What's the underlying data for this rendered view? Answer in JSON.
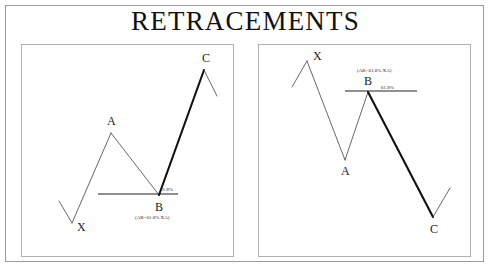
{
  "title": "RETRACEMENTS",
  "colors": {
    "stroke_thin": "#4a4a55",
    "stroke_thick": "#111111",
    "retracement_line": "#222222",
    "panel_border": "#b0b0b0",
    "outer_border": "#9a9a9a",
    "text": "#111111",
    "background": "#ffffff"
  },
  "charts": [
    {
      "name": "bullish-retracement",
      "labels": {
        "x": "X",
        "a": "A",
        "b": "B",
        "c": "C",
        "ratio": "61.8%",
        "formula": "(AB=61.8% XA)"
      },
      "points": {
        "lead_start": {
          "x": 37,
          "y": 156
        },
        "x": {
          "x": 50,
          "y": 178
        },
        "a": {
          "x": 89,
          "y": 88
        },
        "b": {
          "x": 137,
          "y": 150
        },
        "c": {
          "x": 182,
          "y": 25
        },
        "tail_end": {
          "x": 195,
          "y": 51
        }
      },
      "retracement_line": {
        "x1": 76,
        "x2": 156,
        "y": 149
      },
      "label_positions": {
        "x": {
          "x": 55,
          "y": 186
        },
        "a": {
          "x": 85,
          "y": 80
        },
        "b": {
          "x": 133,
          "y": 166
        },
        "c": {
          "x": 180,
          "y": 17
        },
        "ratio": {
          "x": 138,
          "y": 146
        },
        "formula": {
          "x": 113,
          "y": 174
        }
      },
      "segments": [
        {
          "name": "lead-in",
          "from": "lead_start",
          "to": "x",
          "weight": "thin"
        },
        {
          "name": "xa-leg",
          "from": "x",
          "to": "a",
          "weight": "thin"
        },
        {
          "name": "ab-leg",
          "from": "a",
          "to": "b",
          "weight": "thin"
        },
        {
          "name": "bc-leg",
          "from": "b",
          "to": "c",
          "weight": "thick"
        },
        {
          "name": "tail-out",
          "from": "c",
          "to": "tail_end",
          "weight": "thin"
        }
      ]
    },
    {
      "name": "bearish-retracement",
      "labels": {
        "x": "X",
        "a": "A",
        "b": "B",
        "c": "C",
        "ratio": "61.8%",
        "formula": "(AB=61.8% XA)"
      },
      "points": {
        "lead_start": {
          "x": 33,
          "y": 42
        },
        "x": {
          "x": 48,
          "y": 16
        },
        "a": {
          "x": 86,
          "y": 115
        },
        "b": {
          "x": 109,
          "y": 47
        },
        "c": {
          "x": 174,
          "y": 172
        },
        "tail_end": {
          "x": 191,
          "y": 143
        }
      },
      "retracement_line": {
        "x1": 86,
        "x2": 158,
        "y": 46
      },
      "label_positions": {
        "x": {
          "x": 54,
          "y": 15
        },
        "a": {
          "x": 82,
          "y": 130
        },
        "b": {
          "x": 105,
          "y": 40
        },
        "c": {
          "x": 171,
          "y": 188
        },
        "ratio": {
          "x": 122,
          "y": 44
        },
        "formula": {
          "x": 98,
          "y": 27
        }
      },
      "segments": [
        {
          "name": "lead-in",
          "from": "lead_start",
          "to": "x",
          "weight": "thin"
        },
        {
          "name": "xa-leg",
          "from": "x",
          "to": "a",
          "weight": "thin"
        },
        {
          "name": "ab-leg",
          "from": "a",
          "to": "b",
          "weight": "thin"
        },
        {
          "name": "bc-leg",
          "from": "b",
          "to": "c",
          "weight": "thick"
        },
        {
          "name": "tail-out",
          "from": "c",
          "to": "tail_end",
          "weight": "thin"
        }
      ]
    }
  ],
  "chart_data": {
    "type": "line",
    "title": "RETRACEMENTS",
    "xlabel": "",
    "ylabel": "",
    "grid": false,
    "legend": null,
    "panels": [
      {
        "name": "bullish-retracement",
        "description": "Upward XABC retracement pattern",
        "x": [
          "start",
          "X",
          "A",
          "B",
          "C",
          "end"
        ],
        "values": [
          22,
          0,
          90,
          28,
          153,
          127
        ],
        "annotations": [
          "61.8%",
          "(AB=61.8% XA)"
        ]
      },
      {
        "name": "bearish-retracement",
        "description": "Downward XABC retracement pattern",
        "x": [
          "start",
          "X",
          "A",
          "B",
          "C",
          "end"
        ],
        "values": [
          130,
          156,
          57,
          125,
          0,
          29
        ],
        "annotations": [
          "61.8%",
          "(AB=61.8% XA)"
        ]
      }
    ]
  }
}
